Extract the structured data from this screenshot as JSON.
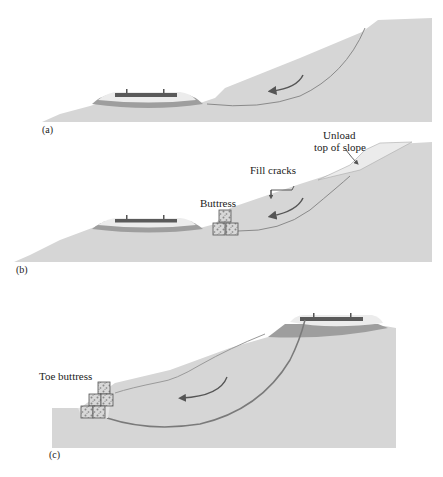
{
  "figure": {
    "panels": [
      {
        "id": "a",
        "label": "(a)",
        "annotations": []
      },
      {
        "id": "b",
        "label": "(b)",
        "annotations": [
          "Buttress",
          "Fill cracks",
          "Unload",
          "top of slope"
        ]
      },
      {
        "id": "c",
        "label": "(c)",
        "annotations": [
          "Toe buttress"
        ]
      }
    ],
    "labels": {
      "a": "(a)",
      "b": "(b)",
      "c": "(c)",
      "buttress": "Buttress",
      "fill_cracks": "Fill cracks",
      "unload_line1": "Unload",
      "unload_line2": "top of slope",
      "toe_buttress": "Toe buttress"
    },
    "colors": {
      "ground": "#d6d6d6",
      "ballast_light": "#ececec",
      "subballast_dark": "#9a9a9a",
      "rail_tie": "#555555",
      "slip_line": "#7a7a7a",
      "arrow": "#555555",
      "unload_fill": "#e8e8e8"
    }
  }
}
